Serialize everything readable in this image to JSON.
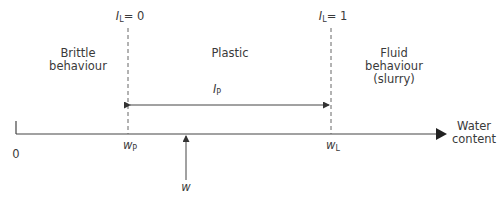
{
  "diagram": {
    "type": "consistency-limits-axis",
    "colors": {
      "line": "#444444",
      "dashed": "#666666",
      "text": "#3a3a3a"
    },
    "regions": [
      {
        "id": "brittle",
        "lines": [
          "Brittle",
          "behaviour"
        ]
      },
      {
        "id": "plastic",
        "lines": [
          "Plastic"
        ]
      },
      {
        "id": "fluid",
        "lines": [
          "Fluid",
          "behaviour",
          "(slurry)"
        ]
      }
    ],
    "boundaries": [
      {
        "id": "plastic-limit",
        "index_symbol": "I",
        "index_sub": "L",
        "index_value": "= 0",
        "axis_symbol": "w",
        "axis_sub": "P"
      },
      {
        "id": "liquid-limit",
        "index_symbol": "I",
        "index_sub": "L",
        "index_value": "= 1",
        "axis_symbol": "w",
        "axis_sub": "L"
      }
    ],
    "plasticity_index": {
      "symbol": "I",
      "sub": "P"
    },
    "axis": {
      "origin_label": "0",
      "title_lines": [
        "Water",
        "content"
      ]
    },
    "marker": {
      "symbol": "w"
    }
  }
}
